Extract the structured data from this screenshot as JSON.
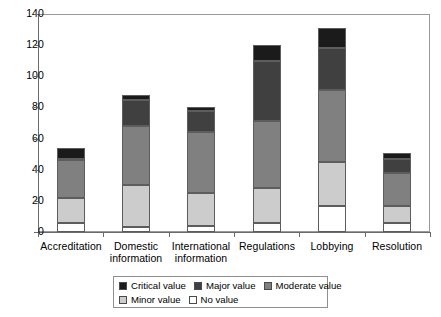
{
  "chart_data": {
    "type": "bar",
    "subtype": "stacked-vertical",
    "title": "",
    "xlabel": "",
    "ylabel": "",
    "ylim": [
      0,
      140
    ],
    "yticks": [
      0,
      20,
      40,
      60,
      80,
      100,
      120,
      140
    ],
    "grid": false,
    "legend_position": "bottom",
    "categories": [
      "Accreditation",
      "Domestic information",
      "International information",
      "Regulations",
      "Lobbying",
      "Resolution"
    ],
    "category_lines": [
      [
        "Accreditation"
      ],
      [
        "Domestic",
        "information"
      ],
      [
        "International",
        "information"
      ],
      [
        "Regulations"
      ],
      [
        "Lobbying"
      ],
      [
        "Resolution"
      ]
    ],
    "stack_order_bottom_to_top": [
      "No value",
      "Minor value",
      "Moderate value",
      "Major value",
      "Critical value"
    ],
    "series": [
      {
        "name": "Critical value",
        "color": "#1b1b1b",
        "values": [
          7,
          3,
          2,
          10,
          13,
          4
        ]
      },
      {
        "name": "Major value",
        "color": "#404040",
        "values": [
          0,
          17,
          14,
          39,
          27,
          9
        ]
      },
      {
        "name": "Moderate value",
        "color": "#808080",
        "values": [
          25,
          38,
          39,
          43,
          46,
          21
        ]
      },
      {
        "name": "Minor value",
        "color": "#cccccc",
        "values": [
          16,
          27,
          21,
          22,
          28,
          11
        ]
      },
      {
        "name": "No value",
        "color": "#ffffff",
        "values": [
          6,
          3,
          4,
          6,
          17,
          6
        ]
      }
    ],
    "totals": [
      54,
      88,
      80,
      120,
      131,
      51
    ],
    "cumulative_tops": [
      {
        "category": "Accreditation",
        "no_value": 6,
        "minor": 22,
        "moderate": 47,
        "major": 47,
        "critical": 54
      },
      {
        "category": "Domestic information",
        "no_value": 3,
        "minor": 30,
        "moderate": 68,
        "major": 85,
        "critical": 88
      },
      {
        "category": "International information",
        "no_value": 4,
        "minor": 25,
        "moderate": 64,
        "major": 78,
        "critical": 80
      },
      {
        "category": "Regulations",
        "no_value": 6,
        "minor": 28,
        "moderate": 71,
        "major": 110,
        "critical": 120
      },
      {
        "category": "Lobbying",
        "no_value": 17,
        "minor": 45,
        "moderate": 91,
        "major": 118,
        "critical": 131
      },
      {
        "category": "Resolution",
        "no_value": 6,
        "minor": 17,
        "moderate": 38,
        "major": 47,
        "critical": 51
      }
    ]
  },
  "legend": {
    "row1": [
      {
        "label": "Critical value",
        "color": "#1b1b1b"
      },
      {
        "label": "Major value",
        "color": "#404040"
      },
      {
        "label": "Moderate value",
        "color": "#808080"
      }
    ],
    "row2": [
      {
        "label": "Minor value",
        "color": "#cccccc"
      },
      {
        "label": "No value",
        "color": "#ffffff"
      }
    ]
  }
}
